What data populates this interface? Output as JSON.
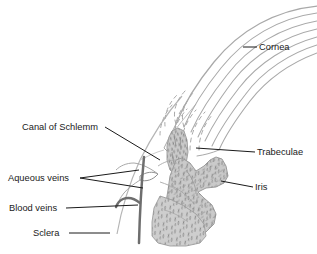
{
  "figure": {
    "kind": "anatomical-diagram",
    "background_color": "#ffffff"
  },
  "labels": {
    "cornea": "Cornea",
    "trabeculae": "Trabeculae",
    "iris": "Iris",
    "canal_of_schlemm": "Canal of Schlemm",
    "aqueous_veins": "Aqueous veins",
    "blood_veins": "Blood veins",
    "sclera": "Sclera"
  },
  "colors": {
    "label_text": "#1a1a1a",
    "leader_line": "#1a1a1a",
    "cornea_striation": "#a9a9a9",
    "sclera_outline": "#b5b5b5",
    "trabeculae_fill": "#c9c9c9",
    "trabeculae_stipple": "#8d8d8d",
    "iris_fill": "#cacaca",
    "iris_stipple": "#8a8a8a",
    "iris_outline": "#9a9a9a",
    "vein_stroke": "#6e6e6e",
    "canal_outline": "#8f8f8f"
  },
  "structures": [
    {
      "name": "cornea",
      "description": "Curved lamellar band of parallel striations, solid superiorly and dashed inferiorly"
    },
    {
      "name": "sclera",
      "description": "Pale curved outline forming the outer coat on the left"
    },
    {
      "name": "trabeculae",
      "description": "Vertical stippled column at the base of the cornea"
    },
    {
      "name": "iris",
      "description": "Irregular stippled mass extending to the right"
    },
    {
      "name": "canal-of-schlemm",
      "description": "Small lens-shaped lumen outline within the sclera"
    },
    {
      "name": "aqueous-veins",
      "description": "Pale channels draining from the canal of Schlemm"
    },
    {
      "name": "blood-veins",
      "description": "Dark vertical vessel with a branch curving to the left"
    }
  ]
}
